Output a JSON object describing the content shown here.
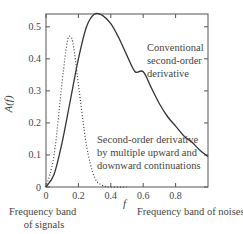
{
  "chart_data": {
    "type": "line",
    "title": "",
    "xlabel": "f",
    "ylabel": "A(f)",
    "xlim": [
      0,
      1.0
    ],
    "ylim": [
      0,
      0.54
    ],
    "xticks": [
      "0",
      "0.2",
      "0.4",
      "0.6",
      "0.8"
    ],
    "xtick_values": [
      0,
      0.2,
      0.4,
      0.6,
      0.8
    ],
    "yticks": [
      "0",
      "0.1",
      "0.2",
      "0.3",
      "0.4",
      "0.5"
    ],
    "ytick_values": [
      0,
      0.1,
      0.2,
      0.3,
      0.4,
      0.5
    ],
    "grid": false,
    "series": [
      {
        "name": "Conventional second-order derivative",
        "style": "solid",
        "x": [
          0,
          0.05,
          0.1,
          0.15,
          0.2,
          0.25,
          0.3,
          0.35,
          0.4,
          0.45,
          0.5,
          0.55,
          0.6,
          0.65,
          0.7,
          0.75,
          0.8,
          0.85,
          0.9,
          0.95,
          1.0
        ],
        "values": [
          0,
          0.04,
          0.14,
          0.27,
          0.4,
          0.5,
          0.54,
          0.535,
          0.51,
          0.465,
          0.41,
          0.36,
          0.36,
          0.31,
          0.26,
          0.22,
          0.19,
          0.16,
          0.14,
          0.115,
          0.095
        ]
      },
      {
        "name": "Second-order derivative by multiple upward and downward continuations",
        "style": "dotted",
        "x": [
          0,
          0.05,
          0.1,
          0.13,
          0.15,
          0.17,
          0.2,
          0.25,
          0.3,
          0.35,
          0.4,
          0.5
        ],
        "values": [
          0,
          0.1,
          0.33,
          0.45,
          0.47,
          0.44,
          0.32,
          0.13,
          0.03,
          0.005,
          0.0,
          0.0
        ]
      }
    ],
    "annotations": [
      {
        "text": "Conventional second-order derivative",
        "lines": [
          "Conventional",
          "second-order",
          "derivative"
        ]
      },
      {
        "text": "Second-order derivative by multiple upward and downward continuations",
        "lines": [
          "Second-order derivative",
          "by multiple upward and",
          "downward continuations"
        ]
      },
      {
        "text": "Frequency band of signals",
        "lines": [
          "Frequency band",
          "of signals"
        ]
      },
      {
        "text": "Frequency band of noises",
        "lines": [
          "Frequency band of noises"
        ]
      }
    ]
  },
  "labels": {
    "ylabel": "A(f)",
    "xlabel": "f",
    "conv": [
      "Conventional",
      "second-order",
      "derivative"
    ],
    "cont": [
      "Second-order derivative",
      "by multiple upward and",
      "downward continuations"
    ],
    "signals": [
      "Frequency band",
      "of signals"
    ],
    "noises": "Frequency band of noises"
  },
  "colors": {
    "line": "#333333",
    "axis": "#555555",
    "text": "#444444"
  }
}
